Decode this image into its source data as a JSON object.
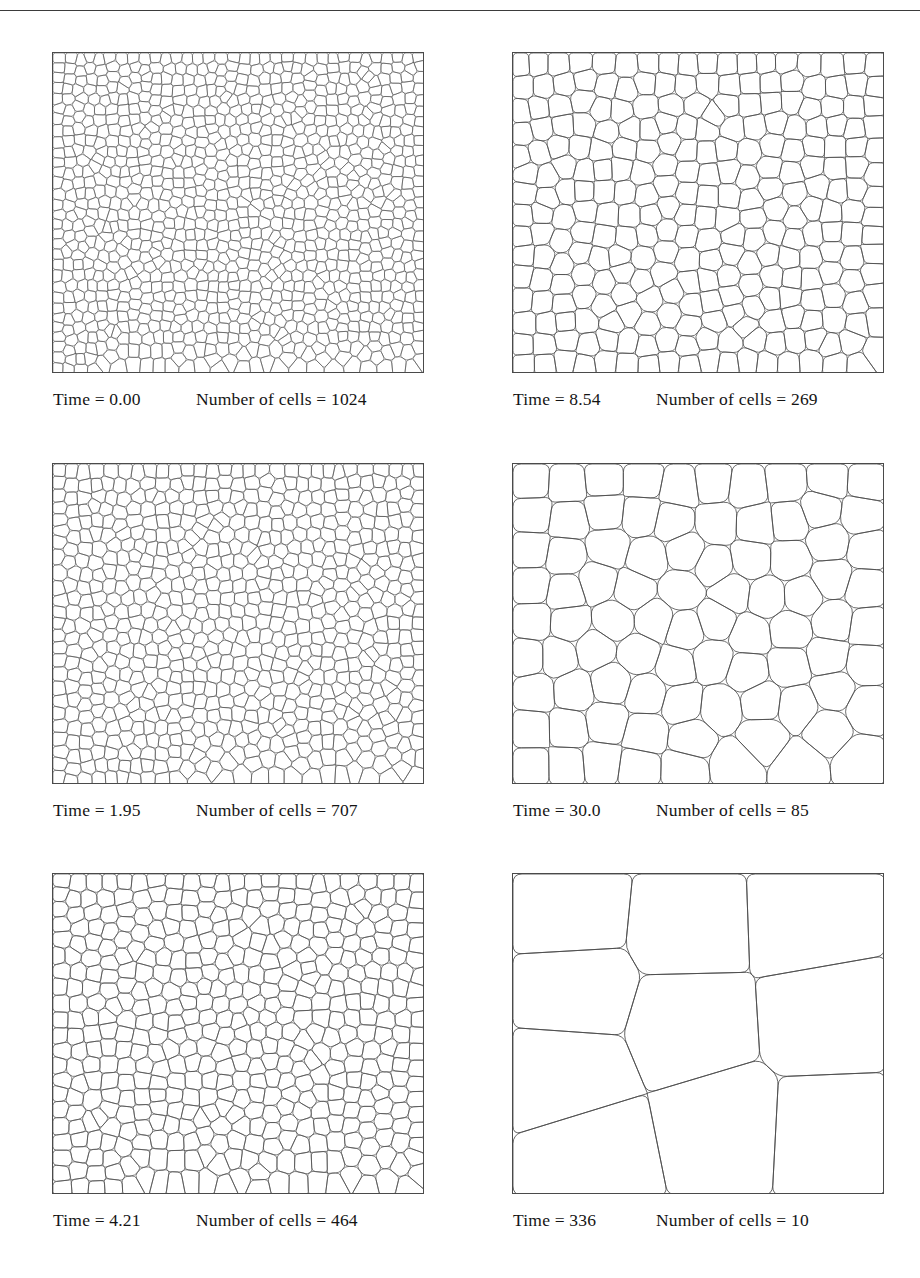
{
  "figure": {
    "rule_present": true,
    "line_color": "#4a4a4a",
    "background_color": "#ffffff",
    "panels": [
      {
        "id": "panel-t0",
        "time_label": "Time = 0.00",
        "count_label": "Number of cells = 1024",
        "time_value": "0.00",
        "cell_count": 1024,
        "seed": 1024,
        "relax": 3,
        "stroke_width": 0.55,
        "x": 52,
        "y": 52,
        "w": 372,
        "h": 321,
        "caption_y": 389
      },
      {
        "id": "panel-t854",
        "time_label": "Time = 8.54",
        "count_label": "Number of cells = 269",
        "time_value": "8.54",
        "cell_count": 269,
        "seed": 269,
        "relax": 4,
        "stroke_width": 0.75,
        "x": 512,
        "y": 52,
        "w": 372,
        "h": 321,
        "caption_y": 389
      },
      {
        "id": "panel-t195",
        "time_label": "Time = 1.95",
        "count_label": "Number of cells = 707",
        "time_value": "1.95",
        "cell_count": 707,
        "seed": 707,
        "relax": 3,
        "stroke_width": 0.6,
        "x": 52,
        "y": 463,
        "w": 372,
        "h": 321,
        "caption_y": 800
      },
      {
        "id": "panel-t300",
        "time_label": "Time = 30.0",
        "count_label": "Number of cells = 85",
        "time_value": "30.0",
        "cell_count": 85,
        "seed": 85,
        "relax": 5,
        "stroke_width": 0.8,
        "x": 512,
        "y": 463,
        "w": 372,
        "h": 321,
        "caption_y": 800
      },
      {
        "id": "panel-t421",
        "time_label": "Time = 4.21",
        "count_label": "Number of cells = 464",
        "time_value": "4.21",
        "cell_count": 464,
        "seed": 464,
        "relax": 4,
        "stroke_width": 0.7,
        "x": 52,
        "y": 873,
        "w": 372,
        "h": 321,
        "caption_y": 1210
      },
      {
        "id": "panel-t336",
        "time_label": "Time = 336",
        "count_label": "Number of cells = 10",
        "time_value": "336",
        "cell_count": 10,
        "seed": 10,
        "relax": 6,
        "stroke_width": 0.85,
        "x": 512,
        "y": 873,
        "w": 372,
        "h": 321,
        "caption_y": 1210
      }
    ]
  },
  "chart_data": {
    "type": "line",
    "xlabel": "Time",
    "ylabel": "Number of cells",
    "x": [
      0.0,
      1.95,
      4.21,
      8.54,
      30.0,
      336
    ],
    "values": [
      1024,
      707,
      464,
      269,
      85,
      10
    ],
    "tick_labels_x": [
      "0.00",
      "1.95",
      "4.21",
      "8.54",
      "30.0",
      "336"
    ],
    "tick_labels_y": [
      "1024",
      "707",
      "464",
      "269",
      "85",
      "10"
    ],
    "grid": false,
    "legend": "none",
    "series": [
      {
        "name": "Number of cells",
        "values": [
          1024,
          707,
          464,
          269,
          85,
          10
        ]
      }
    ]
  }
}
